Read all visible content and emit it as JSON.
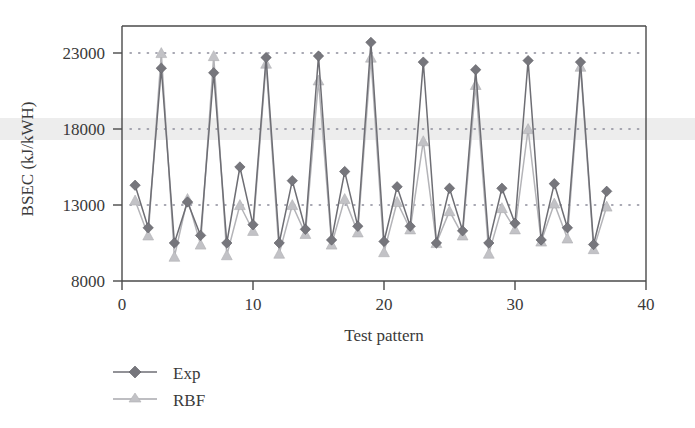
{
  "chart_data": {
    "type": "line",
    "title": "",
    "xlabel": "Test pattern",
    "ylabel": "BSEC (kJ/kWH)",
    "xlim": [
      0,
      40
    ],
    "ylim": [
      8000,
      24500
    ],
    "xticks": [
      0,
      10,
      20,
      30,
      40
    ],
    "yticks": [
      8000,
      13000,
      18000,
      23000
    ],
    "xtick_labels": [
      "0",
      "10",
      "20",
      "30",
      "40"
    ],
    "ytick_labels": [
      "8000",
      "13000",
      "18000",
      "23000"
    ],
    "grid": "horizontal dotted gridlines at y ticks 13000, 18000, 23000",
    "legend_position": "below-axes-left",
    "x": [
      1,
      2,
      3,
      4,
      5,
      6,
      7,
      8,
      9,
      10,
      11,
      12,
      13,
      14,
      15,
      16,
      17,
      18,
      19,
      20,
      21,
      22,
      23,
      24,
      25,
      26,
      27,
      28,
      29,
      30,
      31,
      32,
      33,
      34,
      35,
      36,
      37
    ],
    "series": [
      {
        "name": "Exp",
        "marker": "diamond",
        "color": "#76767c",
        "values": [
          14300,
          11500,
          22000,
          10500,
          13200,
          11000,
          21700,
          10500,
          15500,
          11700,
          22700,
          10500,
          14600,
          11400,
          22800,
          10700,
          15200,
          11600,
          23700,
          10600,
          14200,
          11600,
          22400,
          10500,
          14100,
          11300,
          21900,
          10500,
          14100,
          11800,
          22500,
          10700,
          14400,
          11500,
          22400,
          10400,
          13900
        ]
      },
      {
        "name": "RBF",
        "marker": "triangle",
        "color": "#c2c2c6",
        "values": [
          13300,
          11000,
          23000,
          9600,
          13400,
          10400,
          22800,
          9700,
          13000,
          11300,
          22300,
          9800,
          13000,
          11100,
          21200,
          10400,
          13400,
          11200,
          22700,
          9900,
          13200,
          11400,
          17200,
          10500,
          12600,
          11000,
          20900,
          9800,
          12800,
          11400,
          18000,
          10600,
          13100,
          10800,
          22100,
          10100,
          12900
        ]
      }
    ]
  },
  "legend": {
    "items": [
      {
        "label": "Exp",
        "marker": "diamond",
        "color": "#76767c"
      },
      {
        "label": "RBF",
        "marker": "triangle",
        "color": "#c2c2c6"
      }
    ]
  },
  "axes": {
    "x_title": "Test pattern",
    "y_title": "BSEC (kJ/kWH)"
  }
}
